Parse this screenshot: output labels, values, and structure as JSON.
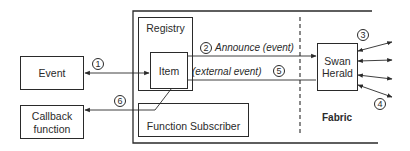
{
  "diagram": {
    "nodes": {
      "event": {
        "label": "Event"
      },
      "callback": {
        "label_line1": "Callback",
        "label_line2": "function"
      },
      "registry": {
        "label": "Registry"
      },
      "item": {
        "label": "Item"
      },
      "function_subscriber": {
        "label": "Function Subscriber"
      },
      "swan_herald": {
        "label_line1": "Swan",
        "label_line2": "Herald"
      },
      "fabric": {
        "label": "Fabric"
      }
    },
    "edges": {
      "announce": {
        "label": "Announce (event)"
      },
      "external": {
        "label": "(external event)"
      }
    },
    "step_markers": [
      "1",
      "2",
      "3",
      "4",
      "5",
      "6"
    ]
  }
}
